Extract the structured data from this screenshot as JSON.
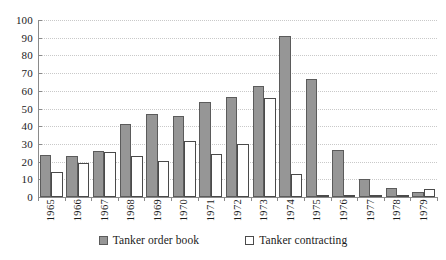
{
  "chart_data": {
    "type": "bar",
    "title": "",
    "xlabel": "",
    "ylabel": "",
    "ylim": [
      0,
      100
    ],
    "yticks": [
      0,
      10,
      20,
      30,
      40,
      50,
      60,
      70,
      80,
      90,
      100
    ],
    "grid": true,
    "legend_position": "bottom",
    "categories": [
      "1965",
      "1966",
      "1967",
      "1968",
      "1969",
      "1970",
      "1971",
      "1972",
      "1973",
      "1974",
      "1975",
      "1976",
      "1977",
      "1978",
      "1979"
    ],
    "series": [
      {
        "name": "Tanker order book",
        "color": "#969696",
        "values": [
          24,
          23,
          26,
          41,
          47,
          45.5,
          53.5,
          56.5,
          63,
          91,
          66.5,
          26.5,
          10,
          5,
          3
        ]
      },
      {
        "name": "Tanker contracting",
        "color": "#ffffff",
        "values": [
          14,
          19,
          25.5,
          23,
          20.5,
          31.5,
          24.5,
          30,
          56,
          13,
          1,
          1,
          1,
          1,
          4.5
        ]
      }
    ]
  },
  "legend": {
    "entries": [
      {
        "label": "Tanker order book"
      },
      {
        "label": "Tanker contracting"
      }
    ]
  },
  "colors": {
    "order_book_fill": "#969696",
    "order_book_border": "#5b5b5b",
    "contracting_fill": "#ffffff",
    "contracting_border": "#4a4a4a",
    "gridline": "#c9c9c9",
    "axis": "#8a8a8a",
    "background": "#ffffff"
  }
}
